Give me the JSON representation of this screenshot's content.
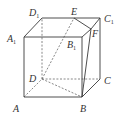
{
  "figure": {
    "type": "cube-geometry",
    "vertices": {
      "A": {
        "label": "A",
        "sub": ""
      },
      "B": {
        "label": "B",
        "sub": ""
      },
      "C": {
        "label": "C",
        "sub": ""
      },
      "D": {
        "label": "D",
        "sub": ""
      },
      "A1": {
        "label": "A",
        "sub": "1"
      },
      "B1": {
        "label": "B",
        "sub": "1"
      },
      "C1": {
        "label": "C",
        "sub": "1"
      },
      "D1": {
        "label": "D",
        "sub": "1"
      },
      "E": {
        "label": "E",
        "sub": ""
      },
      "F": {
        "label": "F",
        "sub": ""
      }
    },
    "visible_edges": [
      [
        "A",
        "B"
      ],
      [
        "B",
        "C"
      ],
      [
        "A",
        "A1"
      ],
      [
        "B",
        "B1"
      ],
      [
        "C",
        "C1"
      ],
      [
        "A1",
        "B1"
      ],
      [
        "A1",
        "D1"
      ],
      [
        "D1",
        "E"
      ],
      [
        "E",
        "C1"
      ],
      [
        "E",
        "F"
      ],
      [
        "F",
        "C1"
      ],
      [
        "B1",
        "F"
      ],
      [
        "F",
        "B"
      ]
    ],
    "hidden_edges": [
      [
        "A",
        "D"
      ],
      [
        "D",
        "C"
      ],
      [
        "D",
        "D1"
      ],
      [
        "D",
        "E"
      ],
      [
        "D",
        "B"
      ]
    ]
  }
}
